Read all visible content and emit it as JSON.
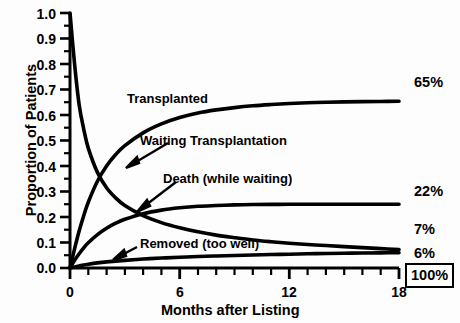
{
  "chart_data": {
    "type": "line",
    "title": "",
    "xlabel": "Months after Listing",
    "ylabel": "Proportion of Patients",
    "xlim": [
      0,
      18.8
    ],
    "ylim": [
      0,
      1.0
    ],
    "grid": false,
    "legend_position": "inline-annotations",
    "xticks": [
      0,
      6,
      12,
      18
    ],
    "xtick_labels": [
      "0",
      "6",
      "12",
      "18"
    ],
    "xminor_step": 1,
    "yticks": [
      0.0,
      0.1,
      0.2,
      0.3,
      0.4,
      0.5,
      0.6,
      0.7,
      0.8,
      0.9,
      1.0
    ],
    "ytick_labels": [
      "0.0",
      "0.1",
      "0.2",
      "0.3",
      "0.4",
      "0.5",
      "0.6",
      "0.7",
      "0.8",
      "0.9",
      "1.0"
    ],
    "yminor_step": 0.05,
    "x": [
      0,
      0.25,
      0.5,
      0.75,
      1,
      1.5,
      2,
      2.5,
      3,
      4,
      5,
      6,
      7,
      8,
      9,
      10,
      11,
      12,
      13,
      14,
      15,
      16,
      17,
      18
    ],
    "series": [
      {
        "name": "Waiting Transplantation",
        "label_x": 8.2,
        "label_y": 0.5,
        "end_value_label": "7%",
        "values": [
          1.0,
          0.8,
          0.64,
          0.545,
          0.47,
          0.375,
          0.315,
          0.275,
          0.245,
          0.205,
          0.178,
          0.158,
          0.142,
          0.129,
          0.119,
          0.11,
          0.103,
          0.097,
          0.092,
          0.088,
          0.084,
          0.08,
          0.076,
          0.072
        ]
      },
      {
        "name": "Transplanted",
        "label_x": 4.3,
        "label_y": 0.695,
        "end_value_label": "65%",
        "values": [
          0.0,
          0.075,
          0.145,
          0.205,
          0.258,
          0.34,
          0.4,
          0.445,
          0.48,
          0.53,
          0.565,
          0.59,
          0.608,
          0.62,
          0.629,
          0.636,
          0.641,
          0.645,
          0.648,
          0.65,
          0.6515,
          0.6525,
          0.653,
          0.654
        ]
      },
      {
        "name": "Death (while waiting)",
        "label_x": 6.0,
        "label_y": 0.405,
        "end_value_label": "22%",
        "values": [
          0.0,
          0.03,
          0.056,
          0.079,
          0.099,
          0.131,
          0.156,
          0.176,
          0.191,
          0.213,
          0.227,
          0.236,
          0.242,
          0.245,
          0.2475,
          0.249,
          0.2495,
          0.25,
          0.25,
          0.25,
          0.25,
          0.25,
          0.25,
          0.25
        ]
      },
      {
        "name": "Removed (too well)",
        "label_x": 5.0,
        "label_y": 0.145,
        "end_value_label": "6%",
        "values": [
          0.0,
          0.004,
          0.008,
          0.012,
          0.015,
          0.02,
          0.024,
          0.027,
          0.03,
          0.035,
          0.039,
          0.042,
          0.045,
          0.047,
          0.049,
          0.051,
          0.053,
          0.054,
          0.056,
          0.057,
          0.058,
          0.059,
          0.0595,
          0.06
        ]
      }
    ],
    "end_labels": [
      {
        "text": "65%",
        "value": 0.65
      },
      {
        "text": "22%",
        "value": 0.25
      },
      {
        "text": "7%",
        "value": 0.118
      },
      {
        "text": "6%",
        "value": 0.06
      }
    ],
    "total_label": "100%",
    "annotations": [
      {
        "text": "Transplanted"
      },
      {
        "text": "Waiting Transplantation"
      },
      {
        "text": "Death (while waiting)"
      },
      {
        "text": "Removed (too well)"
      }
    ],
    "colors": {
      "line": "#000000",
      "axis": "#000000",
      "text": "#000000",
      "background": "#ffffff"
    }
  }
}
